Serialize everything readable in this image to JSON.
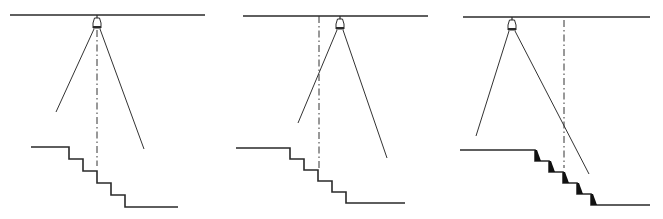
{
  "figure": {
    "colors": {
      "line": "#2a2a2a",
      "background": "#ffffff",
      "nosing": "#111111"
    },
    "panels": [
      {
        "id": "panel-1",
        "label": "Luminaire directly above stair, centerline through middle step",
        "ceiling": {
          "x1": 10,
          "x2": 205,
          "y": 15
        },
        "lamp": {
          "x": 97,
          "y": 15
        },
        "beam_left_end": {
          "x": 56,
          "y": 112
        },
        "beam_right_end": {
          "x": 144,
          "y": 149
        },
        "axis": {
          "x": 97,
          "y1": 30,
          "y2": 166,
          "type": "dashed"
        },
        "stairs": {
          "top_landing_x1": 31,
          "top_y": 147,
          "step_x_start": 69,
          "step_w": 14,
          "step_h": 12,
          "steps": 5,
          "bottom_landing_x2": 178,
          "nosing_marks": false
        }
      },
      {
        "id": "panel-2",
        "label": "Luminaire offset beyond stair centerline",
        "ceiling": {
          "x1": 243,
          "x2": 428,
          "y": 16
        },
        "lamp": {
          "x": 340,
          "y": 16
        },
        "beam_left_end": {
          "x": 298,
          "y": 123
        },
        "beam_right_end": {
          "x": 387,
          "y": 158
        },
        "axis": {
          "x": 319,
          "y1": 16,
          "y2": 168,
          "type": "dash-dot"
        },
        "stairs": {
          "top_landing_x1": 236,
          "top_y": 148,
          "step_x_start": 290,
          "step_w": 14,
          "step_h": 11,
          "steps": 5,
          "bottom_landing_x2": 405,
          "nosing_marks": false
        }
      },
      {
        "id": "panel-3",
        "label": "Luminaire before stair, shadows cast on risers",
        "ceiling": {
          "x1": 463,
          "x2": 650,
          "y": 17
        },
        "lamp": {
          "x": 512,
          "y": 17
        },
        "beam_left_end": {
          "x": 476,
          "y": 136
        },
        "beam_right_end": {
          "x": 589,
          "y": 174
        },
        "axis": {
          "x": 564,
          "y1": 20,
          "y2": 168,
          "type": "dash-dot"
        },
        "stairs": {
          "top_landing_x1": 460,
          "top_y": 150,
          "step_x_start": 535,
          "step_w": 14,
          "step_h": 11,
          "steps": 5,
          "bottom_landing_x2": 650,
          "nosing_marks": true
        }
      }
    ]
  }
}
